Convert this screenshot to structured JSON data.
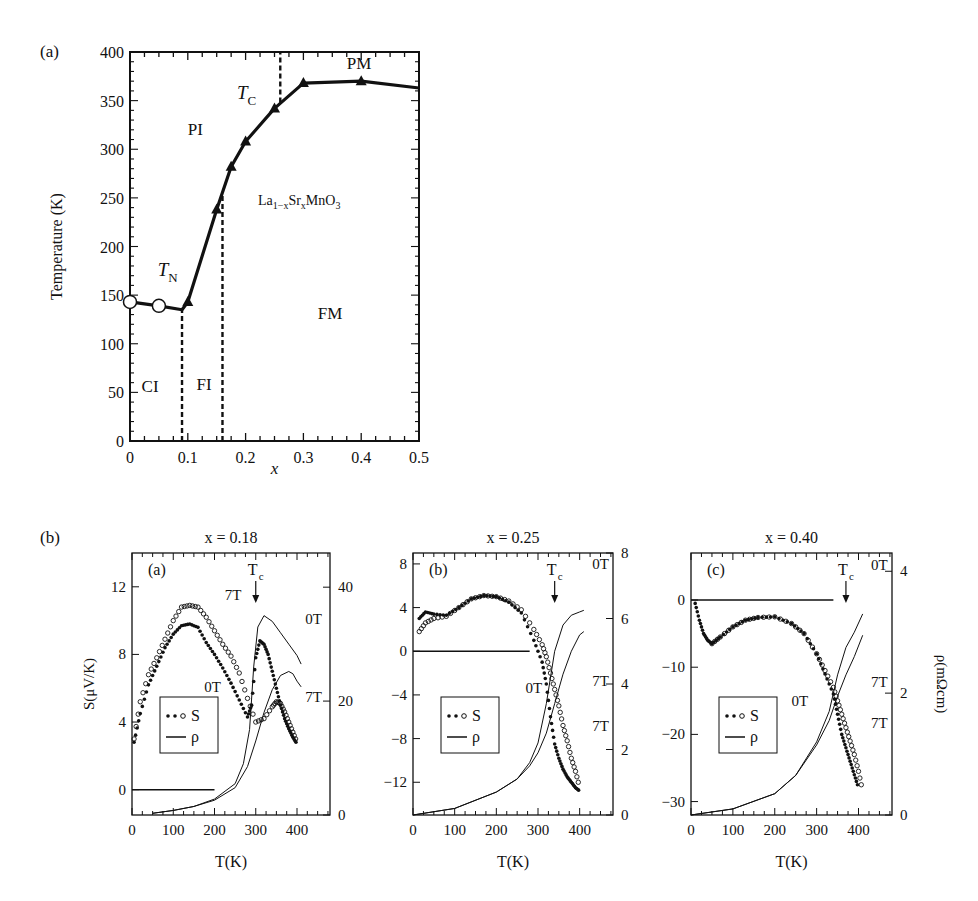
{
  "figure": {
    "panel_a_label": "(a)",
    "panel_b_label": "(b)"
  },
  "chart_data": [
    {
      "id": "phase-diagram",
      "type": "line",
      "title": "",
      "xlabel": "x",
      "ylabel": "Temperature (K)",
      "xlim": [
        0,
        0.5
      ],
      "ylim": [
        0,
        400
      ],
      "xticks": [
        "0",
        "0.1",
        "0.2",
        "0.3",
        "0.4",
        "0.5"
      ],
      "yticks": [
        "0",
        "50",
        "100",
        "150",
        "200",
        "250",
        "300",
        "350",
        "400"
      ],
      "annotation_compound": "La1−xSrxMnO3",
      "region_labels": [
        {
          "text": "PI",
          "x": 0.1,
          "y": 315
        },
        {
          "text": "PM",
          "x": 0.375,
          "y": 383
        },
        {
          "text": "FM",
          "x": 0.325,
          "y": 125
        },
        {
          "text": "CI",
          "x": 0.02,
          "y": 50
        },
        {
          "text": "FI",
          "x": 0.115,
          "y": 52
        }
      ],
      "curve_labels": [
        {
          "text": "TC",
          "x": 0.185,
          "y": 352
        },
        {
          "text": "TN",
          "x": 0.048,
          "y": 170
        }
      ],
      "series": [
        {
          "name": "TN",
          "marker": "open-circle",
          "x": [
            0,
            0.05
          ],
          "y": [
            143,
            139
          ]
        },
        {
          "name": "TC",
          "marker": "filled-triangle",
          "x": [
            0.1,
            0.15,
            0.175,
            0.2,
            0.25,
            0.3,
            0.4
          ],
          "y": [
            143,
            238,
            282,
            308,
            342,
            368,
            370
          ]
        }
      ],
      "boundary_line": {
        "x": [
          0,
          0.05,
          0.09,
          0.1,
          0.15,
          0.175,
          0.2,
          0.25,
          0.3,
          0.4,
          0.5
        ],
        "y": [
          143,
          139,
          135,
          143,
          238,
          282,
          308,
          342,
          368,
          370,
          363
        ]
      },
      "dashed_lines": [
        {
          "x": 0.09,
          "y": [
            0,
            135
          ]
        },
        {
          "x": 0.16,
          "y": [
            0,
            255
          ]
        },
        {
          "x": 0.26,
          "y": [
            348,
            400
          ]
        }
      ],
      "grid": false
    },
    {
      "id": "x018",
      "type": "scatter",
      "title": "x = 0.18",
      "inner_label": "(a)",
      "xlabel": "T(K)",
      "ylabel": "S(μV/K)",
      "y2label": "",
      "xlim": [
        0,
        480
      ],
      "ylim": [
        -1.5,
        14
      ],
      "y2lim": [
        0,
        46
      ],
      "xticks": [
        "0",
        "100",
        "200",
        "300",
        "400"
      ],
      "yticks": [
        "0",
        "4",
        "8",
        "12"
      ],
      "y2ticks": [
        "0",
        "20",
        "40"
      ],
      "tc_label": "Tc",
      "tc_x": 300,
      "legend": [
        "S",
        "ρ"
      ],
      "series": [
        {
          "name": "S 0T",
          "marker": "filled-dot",
          "x": [
            5,
            20,
            40,
            60,
            80,
            100,
            120,
            140,
            160,
            180,
            200,
            220,
            240,
            260,
            280,
            290,
            300,
            310,
            320,
            330,
            340,
            350,
            360,
            370,
            380,
            390,
            400
          ],
          "y": [
            2.8,
            4.5,
            6.2,
            7.3,
            8.4,
            9.2,
            9.7,
            9.8,
            9.6,
            8.7,
            8.0,
            7.2,
            6.3,
            5.3,
            4.3,
            5.0,
            7.8,
            8.8,
            8.6,
            8.0,
            7.0,
            6.0,
            5.0,
            4.2,
            3.6,
            3.1,
            2.7
          ]
        },
        {
          "name": "S 7T",
          "marker": "open-circle",
          "x": [
            5,
            20,
            40,
            60,
            80,
            100,
            120,
            140,
            160,
            180,
            200,
            220,
            240,
            260,
            280,
            300,
            320,
            340,
            350,
            360,
            370,
            380,
            390,
            400
          ],
          "y": [
            3.0,
            5.2,
            6.8,
            7.8,
            8.9,
            10.0,
            10.8,
            10.9,
            10.8,
            10.2,
            9.4,
            8.6,
            7.9,
            6.9,
            5.4,
            4.0,
            4.2,
            4.9,
            5.2,
            5.1,
            4.6,
            4.0,
            3.4,
            2.8
          ]
        },
        {
          "name": "ρ 0T",
          "axis": "right",
          "x": [
            50,
            100,
            150,
            200,
            250,
            270,
            285,
            295,
            305,
            320,
            340,
            360,
            380,
            400,
            410
          ],
          "y": [
            0.3,
            0.8,
            1.5,
            2.8,
            5.5,
            9.0,
            15,
            26,
            33,
            35,
            34,
            32,
            30,
            28,
            26.5
          ]
        },
        {
          "name": "ρ 7T",
          "axis": "right",
          "x": [
            50,
            100,
            150,
            200,
            250,
            280,
            300,
            320,
            340,
            360,
            380,
            390,
            400,
            410
          ],
          "y": [
            0.3,
            0.8,
            1.5,
            2.6,
            4.8,
            8.5,
            13,
            18,
            22,
            24.5,
            25.2,
            24.8,
            23.5,
            22.5
          ]
        },
        {
          "name": "S=0 reference",
          "x": [
            0,
            200
          ],
          "y": [
            0,
            0
          ]
        }
      ],
      "curve_labels": [
        {
          "text": "7T",
          "x": 225,
          "y": 11.2
        },
        {
          "text": "0T",
          "x": 175,
          "y": 5.8
        },
        {
          "text": "0T",
          "x": 420,
          "y": 9.8
        },
        {
          "text": "7T",
          "x": 420,
          "y": 5.2
        }
      ]
    },
    {
      "id": "x025",
      "type": "scatter",
      "title": "x = 0.25",
      "inner_label": "(b)",
      "xlabel": "T(K)",
      "ylabel": "",
      "y2label": "",
      "xlim": [
        0,
        480
      ],
      "ylim": [
        -15,
        9
      ],
      "y2lim": [
        0,
        8
      ],
      "xticks": [
        "0",
        "100",
        "200",
        "300",
        "400"
      ],
      "yticks": [
        "−12",
        "−8",
        "−4",
        "0",
        "4",
        "8"
      ],
      "y2ticks": [
        "0",
        "2",
        "4",
        "6",
        "8"
      ],
      "tc_label": "Tc",
      "tc_x": 340,
      "legend": [
        "S",
        "ρ"
      ],
      "series": [
        {
          "name": "S 0T",
          "marker": "filled-dot",
          "x": [
            15,
            30,
            50,
            80,
            110,
            140,
            170,
            200,
            230,
            260,
            290,
            310,
            320,
            330,
            340,
            350,
            360,
            370,
            380,
            390,
            400
          ],
          "y": [
            3,
            3.6,
            3.4,
            3.3,
            4,
            4.8,
            5.1,
            5,
            4.5,
            3.5,
            1,
            -1,
            -3,
            -6,
            -8.5,
            -9.8,
            -10.8,
            -11.5,
            -12,
            -12.5,
            -12.8
          ]
        },
        {
          "name": "S 7T",
          "marker": "open-circle",
          "x": [
            15,
            30,
            50,
            80,
            110,
            140,
            170,
            200,
            230,
            260,
            290,
            310,
            320,
            330,
            340,
            350,
            360,
            370,
            380,
            390,
            400
          ],
          "y": [
            1.8,
            2.6,
            3.0,
            3.2,
            4,
            4.8,
            5.1,
            5,
            4.6,
            3.8,
            2,
            0.6,
            -0.5,
            -2,
            -3.5,
            -5,
            -6.8,
            -8.2,
            -9.8,
            -11,
            -12.5
          ]
        },
        {
          "name": "ρ 0T",
          "axis": "right",
          "x": [
            0,
            100,
            200,
            250,
            280,
            300,
            320,
            340,
            360,
            380,
            400,
            410
          ],
          "y": [
            0,
            0.2,
            0.7,
            1.1,
            1.6,
            2.2,
            3.4,
            5.0,
            5.8,
            6.1,
            6.2,
            6.25
          ]
        },
        {
          "name": "ρ 7T",
          "axis": "right",
          "x": [
            0,
            100,
            200,
            250,
            280,
            300,
            320,
            340,
            360,
            380,
            400,
            410
          ],
          "y": [
            0,
            0.2,
            0.7,
            1.1,
            1.5,
            1.9,
            2.5,
            3.4,
            4.3,
            5.0,
            5.5,
            5.6
          ]
        },
        {
          "name": "S=0 reference",
          "x": [
            0,
            280
          ],
          "y": [
            0,
            0
          ]
        }
      ],
      "curve_labels": [
        {
          "text": "0T",
          "x": 430,
          "y": 7.5
        },
        {
          "text": "7T",
          "x": 430,
          "y": -3.2
        },
        {
          "text": "0T",
          "x": 270,
          "y": -3.8
        },
        {
          "text": "7T",
          "x": 430,
          "y": -7.3
        }
      ]
    },
    {
      "id": "x040",
      "type": "scatter",
      "title": "x = 0.40",
      "inner_label": "(c)",
      "xlabel": "T(K)",
      "ylabel": "",
      "y2label": "ρ(mΩcm)",
      "xlim": [
        0,
        480
      ],
      "ylim": [
        -32,
        7
      ],
      "y2lim": [
        0,
        4.3
      ],
      "xticks": [
        "0",
        "100",
        "200",
        "300",
        "400"
      ],
      "yticks": [
        "−30",
        "−20",
        "−10",
        "0"
      ],
      "y2ticks": [
        "0",
        "2",
        "4"
      ],
      "tc_label": "Tc",
      "tc_x": 370,
      "legend": [
        "S",
        "ρ"
      ],
      "series": [
        {
          "name": "S 0T",
          "marker": "filled-dot",
          "x": [
            10,
            20,
            30,
            40,
            50,
            70,
            100,
            130,
            160,
            200,
            240,
            270,
            300,
            320,
            340,
            350,
            360,
            370,
            380,
            390,
            400
          ],
          "y": [
            -0.5,
            -3,
            -5,
            -6,
            -6.5,
            -5.5,
            -4,
            -3,
            -2.6,
            -2.5,
            -3.5,
            -5,
            -8,
            -11,
            -14,
            -17,
            -20,
            -22,
            -24,
            -26,
            -28
          ]
        },
        {
          "name": "S 7T",
          "marker": "open-circle",
          "x": [
            50,
            70,
            100,
            130,
            160,
            200,
            240,
            270,
            300,
            320,
            340,
            350,
            360,
            370,
            380,
            390,
            400,
            410
          ],
          "y": [
            -6.5,
            -5.5,
            -4,
            -3,
            -2.6,
            -2.5,
            -3.5,
            -5,
            -8,
            -10.5,
            -13,
            -15,
            -17,
            -19,
            -21,
            -23,
            -25.5,
            -28.5
          ]
        },
        {
          "name": "ρ 0T",
          "axis": "right",
          "x": [
            0,
            100,
            200,
            250,
            300,
            330,
            350,
            370,
            390,
            410
          ],
          "y": [
            0,
            0.1,
            0.35,
            0.65,
            1.2,
            1.7,
            2.3,
            2.75,
            3.0,
            3.3
          ]
        },
        {
          "name": "ρ 7T",
          "axis": "right",
          "x": [
            0,
            100,
            200,
            250,
            300,
            330,
            350,
            370,
            390,
            410
          ],
          "y": [
            0,
            0.1,
            0.35,
            0.65,
            1.15,
            1.55,
            1.95,
            2.3,
            2.6,
            2.95
          ]
        },
        {
          "name": "S=0 reference",
          "x": [
            0,
            340
          ],
          "y": [
            0,
            0
          ]
        }
      ],
      "curve_labels": [
        {
          "text": "0T",
          "x": 430,
          "y": 4.5
        },
        {
          "text": "7T",
          "x": 430,
          "y": -13
        },
        {
          "text": "0T",
          "x": 240,
          "y": -15.8
        },
        {
          "text": "7T",
          "x": 430,
          "y": -19
        }
      ]
    }
  ]
}
